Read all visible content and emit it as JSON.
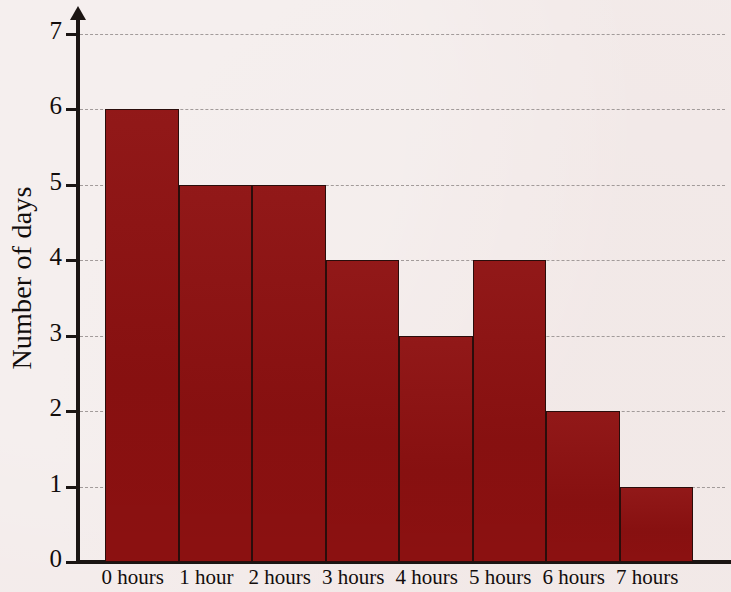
{
  "chart_data": {
    "type": "bar",
    "title": "",
    "subtitle": "",
    "xlabel": "",
    "ylabel": "Number of days",
    "categories": [
      "0 hours",
      "1 hour",
      "2 hours",
      "3 hours",
      "4 hours",
      "5 hours",
      "6 hours",
      "7 hours"
    ],
    "values": [
      6,
      5,
      5,
      4,
      3,
      4,
      2,
      1
    ],
    "ylim": [
      0,
      7
    ],
    "ytick_labels": [
      "0",
      "1",
      "2",
      "3",
      "4",
      "5",
      "6",
      "7"
    ],
    "ytick_values": [
      0,
      1,
      2,
      3,
      4,
      5,
      6,
      7
    ],
    "grid": true,
    "grid_axis": "y",
    "grid_style": "dashed",
    "legend": false,
    "legend_position": "none",
    "bar_gap": 0,
    "annotations": []
  },
  "style": {
    "background_color": "#f3ebea",
    "bar_color": "#8e1111",
    "bar_edge_color": "#2a0d0b",
    "axis_color": "#1b1513",
    "grid_color": "#9a9392",
    "text_color": "#120d0c"
  }
}
